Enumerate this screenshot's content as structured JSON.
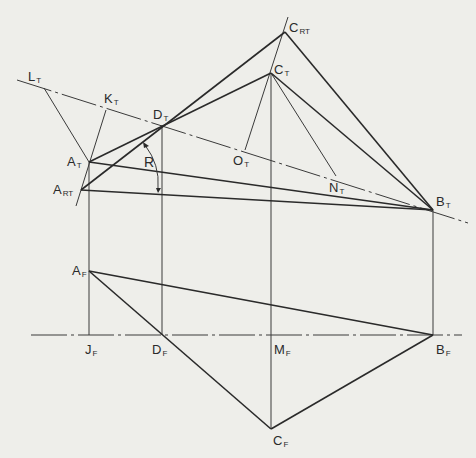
{
  "diagram": {
    "type": "descriptive-geometry-revolution",
    "views": [
      "top",
      "front"
    ],
    "points": {
      "L_T": {
        "label": "L",
        "sub": "T",
        "x": 44,
        "y": 88
      },
      "K_T": {
        "label": "K",
        "sub": "T",
        "x": 106,
        "y": 110
      },
      "D_T": {
        "label": "D",
        "sub": "T",
        "x": 162,
        "y": 125
      },
      "A_T": {
        "label": "A",
        "sub": "T",
        "x": 89,
        "y": 162
      },
      "A_RT": {
        "label": "A",
        "sub": "RT",
        "x": 81,
        "y": 190
      },
      "C_RT": {
        "label": "C",
        "sub": "RT",
        "x": 285,
        "y": 32
      },
      "C_T": {
        "label": "C",
        "sub": "T",
        "x": 271,
        "y": 73
      },
      "O_T": {
        "label": "O",
        "sub": "T",
        "x": 245,
        "y": 150
      },
      "N_T": {
        "label": "N",
        "sub": "T",
        "x": 336,
        "y": 176
      },
      "B_T": {
        "label": "B",
        "sub": "T",
        "x": 433,
        "y": 210
      },
      "A_F": {
        "label": "A",
        "sub": "F",
        "x": 89,
        "y": 271
      },
      "J_F": {
        "label": "J",
        "sub": "F",
        "x": 89,
        "y": 335
      },
      "D_F": {
        "label": "D",
        "sub": "F",
        "x": 162,
        "y": 335
      },
      "M_F": {
        "label": "M",
        "sub": "F",
        "x": 271,
        "y": 335
      },
      "B_F": {
        "label": "B",
        "sub": "F",
        "x": 433,
        "y": 335
      },
      "C_F": {
        "label": "C",
        "sub": "F",
        "x": 271,
        "y": 429
      }
    },
    "angle_label": "R",
    "labels": [
      {
        "id": "L_T",
        "main": "L",
        "sub": "T",
        "x": 28,
        "y": 70
      },
      {
        "id": "K_T",
        "main": "K",
        "sub": "T",
        "x": 104,
        "y": 92
      },
      {
        "id": "D_T",
        "main": "D",
        "sub": "T",
        "x": 153,
        "y": 108
      },
      {
        "id": "A_T",
        "main": "A",
        "sub": "T",
        "x": 67,
        "y": 155
      },
      {
        "id": "A_RT",
        "main": "A",
        "sub": "RT",
        "x": 54,
        "y": 183
      },
      {
        "id": "C_RT",
        "main": "C",
        "sub": "RT",
        "x": 289,
        "y": 21
      },
      {
        "id": "C_T",
        "main": "C",
        "sub": "T",
        "x": 274,
        "y": 63
      },
      {
        "id": "O_T",
        "main": "O",
        "sub": "T",
        "x": 233,
        "y": 154
      },
      {
        "id": "N_T",
        "main": "N",
        "sub": "T",
        "x": 329,
        "y": 181
      },
      {
        "id": "B_T",
        "main": "B",
        "sub": "T",
        "x": 436,
        "y": 195
      },
      {
        "id": "A_F",
        "main": "A",
        "sub": "F",
        "x": 72,
        "y": 264
      },
      {
        "id": "J_F",
        "main": "J",
        "sub": "F",
        "x": 85,
        "y": 343
      },
      {
        "id": "D_F",
        "main": "D",
        "sub": "F",
        "x": 152,
        "y": 343
      },
      {
        "id": "M_F",
        "main": "M",
        "sub": "F",
        "x": 274,
        "y": 343
      },
      {
        "id": "B_F",
        "main": "B",
        "sub": "F",
        "x": 436,
        "y": 343
      },
      {
        "id": "C_F",
        "main": "C",
        "sub": "F",
        "x": 273,
        "y": 434
      }
    ],
    "colors": {
      "background": "#eeeeea",
      "ink": "#2a2a2a"
    }
  }
}
